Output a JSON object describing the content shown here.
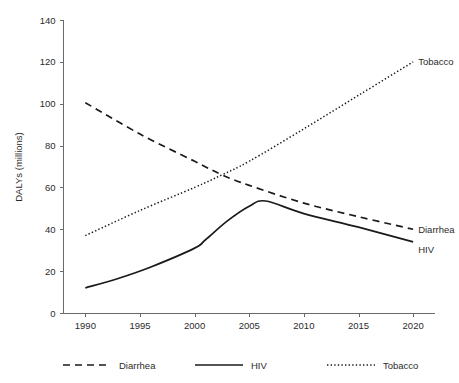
{
  "chart_data": {
    "type": "line",
    "title": "",
    "subtitle": "",
    "xlabel": "",
    "ylabel": "DALYs (millions)",
    "xlim": [
      1988,
      2022
    ],
    "ylim": [
      0,
      140
    ],
    "grid": false,
    "legend_position": "bottom",
    "x_ticks": [
      1990,
      1995,
      2000,
      2005,
      2010,
      2015,
      2020
    ],
    "y_ticks": [
      0,
      20,
      40,
      60,
      80,
      100,
      120,
      140
    ],
    "x_tick_labels": [
      "1990",
      "1995",
      "2000",
      "2005",
      "2010",
      "2015",
      "2020"
    ],
    "y_tick_labels": [
      "0",
      "20",
      "40",
      "60",
      "80",
      "100",
      "120",
      "140"
    ],
    "series": [
      {
        "name": "Diarrhea",
        "style": "dashed",
        "color": "#1a1a1a",
        "end_label": "Diarrhea",
        "x": [
          1990,
          1995,
          2000,
          2002.5,
          2005,
          2010,
          2015,
          2020
        ],
        "values": [
          100.5,
          85.5,
          72.5,
          66.0,
          61.0,
          52.5,
          46.0,
          40.0
        ]
      },
      {
        "name": "HIV",
        "style": "solid",
        "color": "#1a1a1a",
        "end_label": "HIV",
        "x": [
          1990,
          1993,
          1996,
          2000,
          2001,
          2003,
          2005,
          2006.5,
          2010,
          2015,
          2020
        ],
        "values": [
          12.0,
          16.5,
          22.0,
          31.0,
          35.0,
          44.0,
          51.0,
          53.5,
          47.5,
          41.0,
          34.0
        ]
      },
      {
        "name": "Tobacco",
        "style": "dotted",
        "color": "#1a1a1a",
        "end_label": "Tobacco",
        "x": [
          1990,
          1995,
          2000,
          2002.5,
          2005,
          2010,
          2015,
          2020
        ],
        "values": [
          37.0,
          49.0,
          60.0,
          66.0,
          72.5,
          88.0,
          104.0,
          120.0
        ]
      }
    ]
  },
  "legend": {
    "items": [
      {
        "label": "Diarrhea",
        "style": "dashed"
      },
      {
        "label": "HIV",
        "style": "solid"
      },
      {
        "label": "Tobacco",
        "style": "dotted"
      }
    ]
  }
}
